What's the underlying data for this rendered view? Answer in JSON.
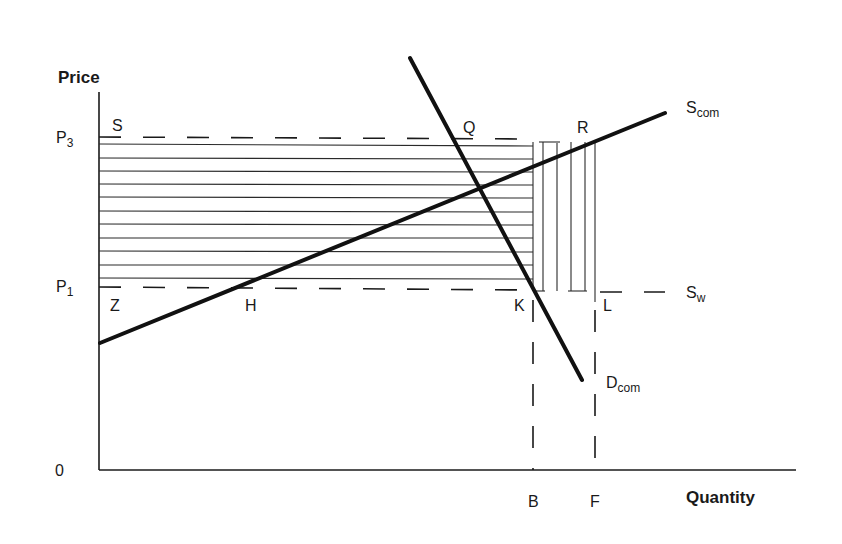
{
  "diagram": {
    "type": "supply-demand-welfare",
    "axes": {
      "y_label": "Price",
      "x_label": "Quantity",
      "origin_label": "0",
      "y_ticks": [
        {
          "main": "P",
          "sub": "3"
        },
        {
          "main": "P",
          "sub": "1"
        }
      ],
      "x_ticks": [
        "B",
        "F"
      ]
    },
    "curves": {
      "supply_com": {
        "main": "S",
        "sub": "com"
      },
      "demand_com": {
        "main": "D",
        "sub": "com"
      },
      "supply_world": {
        "main": "S",
        "sub": "w"
      }
    },
    "points": {
      "S": "S",
      "Q": "Q",
      "R": "R",
      "Z": "Z",
      "H": "H",
      "K": "K",
      "L": "L"
    },
    "shading": {
      "horizontal_hatch_region": "rectangle S–P3 to K–P1 (Z to B between P1 and P3)",
      "vertical_hatch_region": "rectangle between B and F from P1 to P3"
    }
  }
}
